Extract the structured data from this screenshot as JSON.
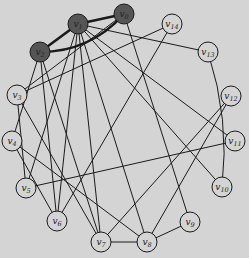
{
  "graph": {
    "nodes": [
      {
        "id": "v0",
        "label": "v",
        "sub": "0",
        "x": 124,
        "y": 14,
        "highlight": true
      },
      {
        "id": "v1",
        "label": "v",
        "sub": "1",
        "x": 78,
        "y": 24,
        "highlight": true
      },
      {
        "id": "v2",
        "label": "v",
        "sub": "2",
        "x": 40,
        "y": 52,
        "highlight": true
      },
      {
        "id": "v3",
        "label": "v",
        "sub": "3",
        "x": 17,
        "y": 95,
        "highlight": false
      },
      {
        "id": "v4",
        "label": "v",
        "sub": "4",
        "x": 12,
        "y": 141,
        "highlight": false
      },
      {
        "id": "v5",
        "label": "v",
        "sub": "5",
        "x": 26,
        "y": 188,
        "highlight": false
      },
      {
        "id": "v6",
        "label": "v",
        "sub": "6",
        "x": 57,
        "y": 221,
        "highlight": false
      },
      {
        "id": "v7",
        "label": "v",
        "sub": "7",
        "x": 101,
        "y": 242,
        "highlight": false
      },
      {
        "id": "v8",
        "label": "v",
        "sub": "8",
        "x": 147,
        "y": 242,
        "highlight": false
      },
      {
        "id": "v9",
        "label": "v",
        "sub": "9",
        "x": 190,
        "y": 222,
        "highlight": false
      },
      {
        "id": "v10",
        "label": "v",
        "sub": "10",
        "x": 222,
        "y": 187,
        "highlight": false
      },
      {
        "id": "v11",
        "label": "v",
        "sub": "11",
        "x": 235,
        "y": 141,
        "highlight": false
      },
      {
        "id": "v12",
        "label": "v",
        "sub": "12",
        "x": 231,
        "y": 96,
        "highlight": false
      },
      {
        "id": "v13",
        "label": "v",
        "sub": "13",
        "x": 208,
        "y": 52,
        "highlight": false
      },
      {
        "id": "v14",
        "label": "v",
        "sub": "14",
        "x": 172,
        "y": 24,
        "highlight": false
      }
    ],
    "highlighted_edges": [
      [
        "v1",
        "v0"
      ],
      [
        "v2",
        "v1"
      ],
      [
        "v2",
        "v0"
      ]
    ],
    "edges": [
      [
        "v1",
        "v13"
      ],
      [
        "v1",
        "v11"
      ],
      [
        "v1",
        "v10"
      ],
      [
        "v1",
        "v8"
      ],
      [
        "v1",
        "v7"
      ],
      [
        "v1",
        "v5"
      ],
      [
        "v1",
        "v6"
      ],
      [
        "v0",
        "v9"
      ],
      [
        "v0",
        "v3"
      ],
      [
        "v14",
        "v3"
      ],
      [
        "v14",
        "v6"
      ],
      [
        "v2",
        "v6"
      ],
      [
        "v2",
        "v7"
      ],
      [
        "v2",
        "v4"
      ],
      [
        "v3",
        "v7"
      ],
      [
        "v3",
        "v5"
      ],
      [
        "v4",
        "v8"
      ],
      [
        "v4",
        "v6"
      ],
      [
        "v5",
        "v11"
      ],
      [
        "v7",
        "v8"
      ],
      [
        "v8",
        "v9"
      ],
      [
        "v8",
        "v12"
      ],
      [
        "v7",
        "v12"
      ],
      [
        "v13",
        "v10"
      ]
    ],
    "colors": {
      "background": "#d4d4d4",
      "node_fill": "#d4d4d4",
      "highlight_fill": "#555555",
      "stroke": "#1a1a1a"
    }
  }
}
